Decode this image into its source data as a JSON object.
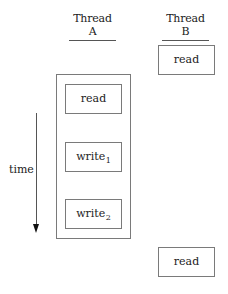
{
  "diagram": {
    "columns": [
      {
        "id": "thread-a",
        "label": "Thread A"
      },
      {
        "id": "thread-b",
        "label": "Thread B"
      }
    ],
    "thread_a": {
      "grouped": true,
      "operations": [
        {
          "label": "read",
          "subscript": ""
        },
        {
          "label": "write",
          "subscript": "1"
        },
        {
          "label": "write",
          "subscript": "2"
        }
      ]
    },
    "thread_b": {
      "operations": [
        {
          "label": "read",
          "position": "before"
        },
        {
          "label": "read",
          "position": "after"
        }
      ]
    },
    "time_axis": {
      "label": "time",
      "direction": "down"
    },
    "colors": {
      "border": "#7a7a7a",
      "text": "#222222",
      "arrow": "#111111"
    }
  }
}
